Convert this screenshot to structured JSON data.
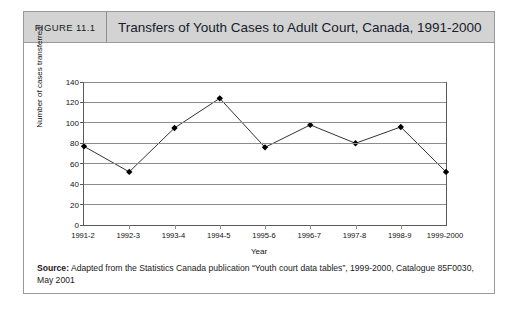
{
  "figure": {
    "number_label": "FIGURE 11.1",
    "title": "Transfers of Youth Cases to Adult Court, Canada, 1991-2000",
    "source_label": "Source:",
    "source_text": " Adapted from the Statistics Canada publication “Youth court data tables”, 1999-2000, Catalogue 85F0030, May 2001"
  },
  "chart_data": {
    "type": "line",
    "title": "Transfers of Youth Cases to Adult Court, Canada, 1991-2000",
    "xlabel": "Year",
    "ylabel": "Number of cases transferred",
    "categories": [
      "1991-2",
      "1992-3",
      "1993-4",
      "1994-5",
      "1995-6",
      "1996-7",
      "1997-8",
      "1998-9",
      "1999-2000"
    ],
    "values": [
      77,
      52,
      95,
      124,
      76,
      98,
      80,
      96,
      52
    ],
    "ylim": [
      0,
      140
    ],
    "yticks": [
      0,
      20,
      40,
      60,
      80,
      100,
      120,
      140
    ],
    "ytick_labels": [
      "0",
      "20",
      "40",
      "60",
      "80",
      "100",
      "120",
      "140"
    ],
    "grid": true,
    "legend": "none",
    "marker": "filled-diamond",
    "line_color": "#333333",
    "marker_color": "#000000"
  }
}
